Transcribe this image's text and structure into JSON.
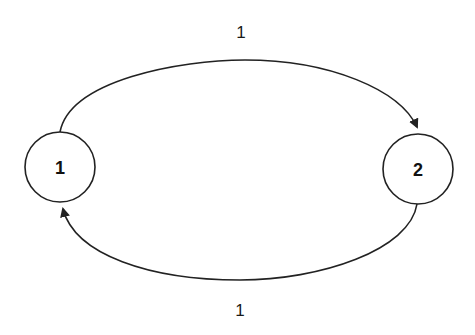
{
  "diagram": {
    "type": "directed-graph",
    "colors": {
      "stroke": "#222222",
      "background": "#ffffff",
      "text": "#111111"
    },
    "nodes": [
      {
        "id": "n1",
        "label": "1",
        "cx": 60,
        "cy": 167,
        "r": 35
      },
      {
        "id": "n2",
        "label": "2",
        "cx": 418,
        "cy": 169,
        "r": 35
      }
    ],
    "edges": [
      {
        "id": "e1",
        "from": "1",
        "to": "2",
        "label": "1",
        "position": "top"
      },
      {
        "id": "e2",
        "from": "2",
        "to": "1",
        "label": "1",
        "position": "bottom"
      }
    ]
  }
}
